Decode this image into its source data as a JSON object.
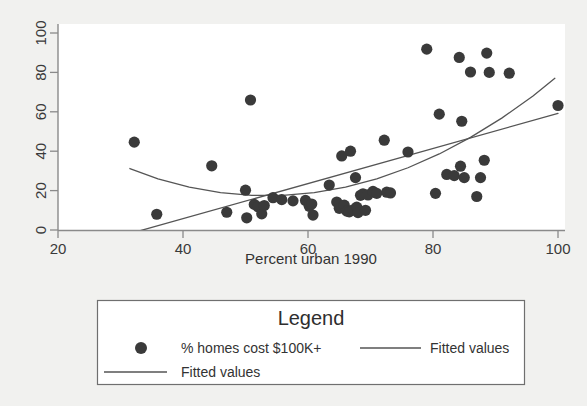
{
  "chart_data": {
    "type": "scatter",
    "title": "",
    "xlabel": "Percent urban 1990",
    "ylabel": "",
    "xlim": [
      20,
      100
    ],
    "ylim": [
      0,
      100
    ],
    "xticks": [
      20,
      40,
      60,
      80,
      100
    ],
    "yticks": [
      0,
      20,
      40,
      60,
      80,
      100
    ],
    "xtick_labels": [
      "20",
      "40",
      "60",
      "80",
      "100"
    ],
    "ytick_labels": [
      "0",
      "20",
      "40",
      "60",
      "80",
      "100"
    ],
    "grid": false,
    "legend_position": "below-plot",
    "marker_color": "#3a3a3a",
    "line_color": "#555555",
    "frame_color": "#8a8a8a",
    "plot_background": "#ffffff",
    "figure_background": "#f1f1ef",
    "series": [
      {
        "name": "% homes cost $100K+",
        "type": "scatter",
        "marker": "filled-circle",
        "points": [
          [
            32.2,
            44.6
          ],
          [
            35.8,
            8.0
          ],
          [
            44.6,
            32.6
          ],
          [
            47.0,
            9.0
          ],
          [
            50.0,
            20.2
          ],
          [
            50.2,
            6.2
          ],
          [
            50.8,
            66.0
          ],
          [
            51.4,
            13.0
          ],
          [
            52.0,
            11.8
          ],
          [
            52.6,
            8.2
          ],
          [
            53.0,
            12.4
          ],
          [
            54.4,
            16.4
          ],
          [
            55.8,
            15.4
          ],
          [
            57.6,
            14.8
          ],
          [
            59.6,
            15.0
          ],
          [
            60.2,
            12.0
          ],
          [
            60.6,
            13.2
          ],
          [
            60.8,
            7.6
          ],
          [
            63.4,
            22.8
          ],
          [
            64.6,
            14.2
          ],
          [
            65.0,
            11.0
          ],
          [
            65.4,
            37.6
          ],
          [
            65.8,
            12.6
          ],
          [
            66.2,
            9.6
          ],
          [
            66.6,
            9.2
          ],
          [
            66.8,
            40.0
          ],
          [
            67.2,
            10.2
          ],
          [
            67.6,
            26.6
          ],
          [
            67.8,
            11.6
          ],
          [
            68.0,
            8.8
          ],
          [
            68.4,
            17.6
          ],
          [
            68.8,
            18.4
          ],
          [
            69.2,
            10.0
          ],
          [
            69.6,
            17.8
          ],
          [
            70.4,
            19.6
          ],
          [
            71.0,
            18.6
          ],
          [
            72.2,
            45.6
          ],
          [
            72.6,
            19.2
          ],
          [
            73.2,
            18.8
          ],
          [
            76.0,
            39.6
          ],
          [
            79.0,
            91.8
          ],
          [
            80.4,
            18.6
          ],
          [
            81.0,
            58.8
          ],
          [
            82.2,
            28.2
          ],
          [
            83.4,
            27.6
          ],
          [
            84.2,
            87.6
          ],
          [
            84.4,
            32.4
          ],
          [
            84.6,
            55.2
          ],
          [
            85.0,
            26.6
          ],
          [
            86.0,
            80.2
          ],
          [
            87.0,
            17.0
          ],
          [
            87.6,
            26.6
          ],
          [
            88.2,
            35.4
          ],
          [
            88.6,
            89.8
          ],
          [
            89.0,
            80.0
          ],
          [
            92.2,
            79.6
          ],
          [
            100.0,
            63.2
          ]
        ]
      },
      {
        "name": "Fitted values",
        "type": "line",
        "style": "quadratic-fit",
        "points": [
          [
            31.5,
            31.2
          ],
          [
            36.0,
            26.0
          ],
          [
            41.0,
            21.8
          ],
          [
            46.0,
            19.0
          ],
          [
            51.0,
            17.6
          ],
          [
            56.0,
            17.6
          ],
          [
            61.0,
            19.0
          ],
          [
            66.0,
            21.8
          ],
          [
            71.0,
            26.0
          ],
          [
            76.0,
            31.6
          ],
          [
            81.0,
            38.6
          ],
          [
            86.0,
            47.0
          ],
          [
            91.0,
            56.8
          ],
          [
            96.0,
            68.0
          ],
          [
            99.5,
            77.0
          ]
        ]
      },
      {
        "name": "Fitted values",
        "type": "line",
        "style": "linear-fit",
        "points": [
          [
            31.5,
            -1.8
          ],
          [
            100.0,
            59.2
          ]
        ]
      }
    ]
  },
  "legend": {
    "title": "Legend",
    "entries": [
      {
        "label": "% homes cost $100K+",
        "marker": "filled-circle"
      },
      {
        "label": "Fitted values",
        "marker": "line"
      },
      {
        "label": "Fitted values",
        "marker": "line"
      }
    ]
  }
}
